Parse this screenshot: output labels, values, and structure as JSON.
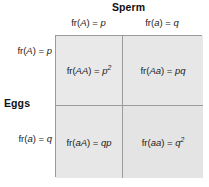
{
  "figure": {
    "name": "hardy-weinberg-punnett-square",
    "column_header": "Sperm",
    "row_header": "Eggs",
    "columns": [
      {
        "id": "A",
        "label": "fr(A) = p",
        "fr_prefix": "fr(",
        "allele": "A",
        "suffix": ") = ",
        "freq": "p"
      },
      {
        "id": "a",
        "label": "fr(a) = q",
        "fr_prefix": "fr(",
        "allele": "a",
        "suffix": ") = ",
        "freq": "q"
      }
    ],
    "rows": [
      {
        "id": "A",
        "label": "fr(A) = p",
        "fr_prefix": "fr(",
        "allele": "A",
        "suffix": ") = ",
        "freq": "p"
      },
      {
        "id": "a",
        "label": "fr(a) = q",
        "fr_prefix": "fr(",
        "allele": "a",
        "suffix": ") = ",
        "freq": "q"
      }
    ],
    "cells": [
      {
        "id": "AA",
        "text": "fr(AA) = p2",
        "fr_prefix": "fr(",
        "genotype": "AA",
        "suffix": ") = ",
        "value_base": "p",
        "value_exponent": "2"
      },
      {
        "id": "Aa",
        "text": "fr(Aa) = pq",
        "fr_prefix": "fr(",
        "genotype": "Aa",
        "suffix": ") = ",
        "value_base": "pq",
        "value_exponent": ""
      },
      {
        "id": "aA",
        "text": "fr(aA) = qp",
        "fr_prefix": "fr(",
        "genotype": "aA",
        "suffix": ") = ",
        "value_base": "qp",
        "value_exponent": ""
      },
      {
        "id": "aa",
        "text": "fr(aa) = q2",
        "fr_prefix": "fr(",
        "genotype": "aa",
        "suffix": ") = ",
        "value_base": "q",
        "value_exponent": "2"
      }
    ],
    "colors": {
      "cell_fill": "#e7e7e7",
      "grid_line": "#9b9b9b",
      "text": "#1a1a1a",
      "background": "#ffffff"
    }
  }
}
